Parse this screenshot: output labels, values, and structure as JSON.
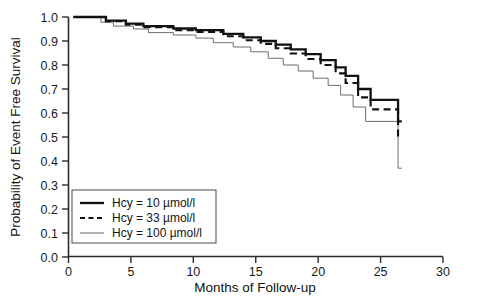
{
  "chart_data": {
    "type": "line",
    "subtype": "kaplan-meier-step",
    "title": "",
    "xlabel": "Months of Follow-up",
    "ylabel": "Probability of Event Free Survival",
    "xlim": [
      0,
      30
    ],
    "ylim": [
      0.0,
      1.0
    ],
    "xticks": [
      0,
      5,
      10,
      15,
      20,
      25,
      30
    ],
    "xticklabels": [
      "0",
      "5",
      "10",
      "15",
      "20",
      "25",
      "30"
    ],
    "yticks": [
      0.0,
      0.1,
      0.2,
      0.3,
      0.4,
      0.5,
      0.6,
      0.7,
      0.8,
      0.9,
      1.0
    ],
    "yticklabels": [
      "0.0",
      "0.1",
      "0.2",
      "0.3",
      "0.4",
      "0.5",
      "0.6",
      "0.7",
      "0.8",
      "0.9",
      "1.0"
    ],
    "grid": false,
    "legend_position": "lower-left",
    "series": [
      {
        "name": "Hcy = 10 µmol/l",
        "style": "solid-thick",
        "color": "#111111",
        "x": [
          0.4,
          3.0,
          3.0,
          4.6,
          4.6,
          6.0,
          6.0,
          8.4,
          8.4,
          10.2,
          10.2,
          12.4,
          12.4,
          14.0,
          14.0,
          15.4,
          15.4,
          16.6,
          16.6,
          17.8,
          17.8,
          19.0,
          19.0,
          20.2,
          20.2,
          21.4,
          21.4,
          22.2,
          22.2,
          23.2,
          23.2,
          24.2,
          24.2,
          26.4,
          26.4,
          26.7
        ],
        "y": [
          1.0,
          1.0,
          0.985,
          0.985,
          0.972,
          0.972,
          0.962,
          0.962,
          0.952,
          0.952,
          0.945,
          0.945,
          0.93,
          0.93,
          0.915,
          0.915,
          0.9,
          0.9,
          0.885,
          0.885,
          0.865,
          0.865,
          0.845,
          0.845,
          0.82,
          0.82,
          0.79,
          0.79,
          0.755,
          0.755,
          0.7,
          0.7,
          0.655,
          0.655,
          0.565,
          0.565
        ]
      },
      {
        "name": "Hcy = 33 µmol/l",
        "style": "dashed",
        "color": "#111111",
        "x": [
          0.4,
          3.0,
          3.0,
          4.6,
          4.6,
          6.0,
          6.0,
          8.4,
          8.4,
          10.2,
          10.2,
          12.4,
          12.4,
          14.0,
          14.0,
          15.4,
          15.4,
          16.6,
          16.6,
          17.8,
          17.8,
          19.0,
          19.0,
          20.2,
          20.2,
          21.4,
          21.4,
          22.2,
          22.2,
          23.2,
          23.2,
          24.2,
          24.2,
          26.4,
          26.4,
          26.7
        ],
        "y": [
          1.0,
          1.0,
          0.982,
          0.982,
          0.968,
          0.968,
          0.957,
          0.957,
          0.945,
          0.945,
          0.938,
          0.938,
          0.92,
          0.92,
          0.903,
          0.903,
          0.888,
          0.888,
          0.87,
          0.87,
          0.848,
          0.848,
          0.825,
          0.825,
          0.8,
          0.8,
          0.765,
          0.765,
          0.725,
          0.725,
          0.665,
          0.665,
          0.615,
          0.615,
          0.5,
          0.5
        ]
      },
      {
        "name": "Hcy = 100 µmol/l",
        "style": "solid-thin",
        "color": "#6d6d6d",
        "x": [
          0.4,
          2.6,
          2.6,
          3.6,
          3.6,
          5.2,
          5.2,
          6.4,
          6.4,
          8.4,
          8.4,
          10.2,
          10.2,
          11.6,
          11.6,
          13.2,
          13.2,
          14.6,
          14.6,
          16.0,
          16.0,
          17.2,
          17.2,
          18.4,
          18.4,
          19.6,
          19.6,
          20.8,
          20.8,
          21.8,
          21.8,
          22.8,
          22.8,
          23.8,
          23.8,
          26.4,
          26.4,
          26.7
        ],
        "y": [
          1.0,
          1.0,
          0.978,
          0.978,
          0.962,
          0.962,
          0.95,
          0.95,
          0.935,
          0.935,
          0.925,
          0.925,
          0.912,
          0.912,
          0.893,
          0.893,
          0.875,
          0.875,
          0.855,
          0.855,
          0.828,
          0.828,
          0.8,
          0.8,
          0.775,
          0.775,
          0.745,
          0.745,
          0.715,
          0.715,
          0.675,
          0.675,
          0.625,
          0.625,
          0.565,
          0.565,
          0.37,
          0.37
        ]
      }
    ]
  },
  "axes": {
    "xlabel": "Months of Follow-up",
    "ylabel": "Probability of Event Free Survival"
  },
  "legend": {
    "items": [
      {
        "label": "Hcy = 10 µmol/l",
        "style": "solid-thick"
      },
      {
        "label": "Hcy = 33 µmol/l",
        "style": "dashed"
      },
      {
        "label": "Hcy = 100 µmol/l",
        "style": "solid-thin"
      }
    ]
  }
}
